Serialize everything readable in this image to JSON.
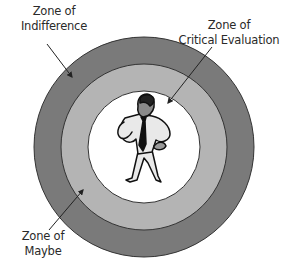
{
  "diagram": {
    "center_figure": "businessman-thinking",
    "zones": [
      {
        "id": "indifference",
        "line1": "Zone of",
        "line2": "Indifference",
        "ring": "outer",
        "color": "#7a7a7a"
      },
      {
        "id": "maybe",
        "line1": "Zone of",
        "line2": "Maybe",
        "ring": "outer",
        "color": "#7a7a7a"
      },
      {
        "id": "critical-evaluation",
        "line1": "Zone of",
        "line2": "Critical Evaluation",
        "ring": "middle",
        "color": "#b4b4b4"
      }
    ],
    "colors": {
      "outer_ring": "#7a7a7a",
      "middle_ring": "#b4b4b4",
      "inner_circle": "#ffffff",
      "outline": "#333333"
    }
  }
}
